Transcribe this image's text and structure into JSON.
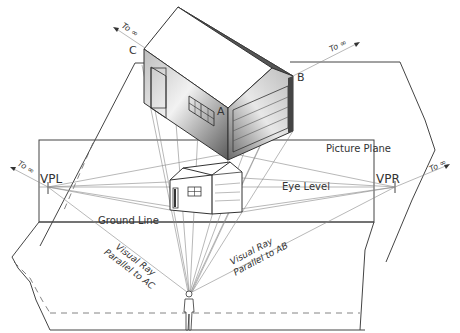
{
  "diagram": {
    "labels": {
      "picture_plane": "Picture Plane",
      "eye_level": "Eye Level",
      "ground_line": "Ground Line",
      "vpl": "VPL",
      "vpr": "VPR",
      "point_a": "A",
      "point_b": "B",
      "point_c": "C",
      "to_infinity": "To ∞",
      "visual_ray_ac_line1": "Visual Ray",
      "visual_ray_ac_line2": "Parallel to AC",
      "visual_ray_ab_line1": "Visual Ray",
      "visual_ray_ab_line2": "Parallel to AB"
    },
    "elements": [
      {
        "name": "ground-plane-upper",
        "type": "plane"
      },
      {
        "name": "picture-plane",
        "type": "plane"
      },
      {
        "name": "ground-plane-lower",
        "type": "plane"
      },
      {
        "name": "house-3d",
        "type": "object"
      },
      {
        "name": "house-projection",
        "type": "object"
      },
      {
        "name": "observer",
        "type": "figure"
      }
    ],
    "colors": {
      "line": "#444444",
      "ray": "#888888",
      "house_shade_dark": "#555555",
      "house_shade_light": "#eeeeee"
    }
  }
}
